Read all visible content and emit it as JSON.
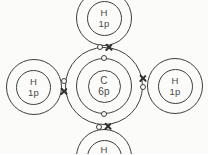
{
  "colors": {
    "background": "#fbfbf9",
    "line": "#3e3e3e",
    "text": "#4a4a4a"
  },
  "atoms": {
    "carbon": {
      "symbol": "C",
      "nucleus_label": "6p",
      "shells": 2,
      "inner_shell_electron_count": 2,
      "outer_shell_bonding_pairs": 4
    },
    "hydrogen_top": {
      "symbol": "H",
      "nucleus_label": "1p"
    },
    "hydrogen_left": {
      "symbol": "H",
      "nucleus_label": "1p"
    },
    "hydrogen_right": {
      "symbol": "H",
      "nucleus_label": "1p"
    },
    "hydrogen_bottom": {
      "symbol": "H"
    }
  },
  "bonds": [
    {
      "position": "top",
      "carbon_electron": "open-circle",
      "hydrogen_electron": "cross",
      "pair_orientation": "horizontal"
    },
    {
      "position": "left",
      "carbon_electron": "open-circle",
      "hydrogen_electron": "cross",
      "pair_orientation": "vertical"
    },
    {
      "position": "right",
      "carbon_electron": "open-circle",
      "hydrogen_electron": "cross",
      "pair_orientation": "vertical"
    },
    {
      "position": "bottom",
      "carbon_electron": "open-circle",
      "hydrogen_electron": "cross",
      "pair_orientation": "horizontal"
    }
  ]
}
